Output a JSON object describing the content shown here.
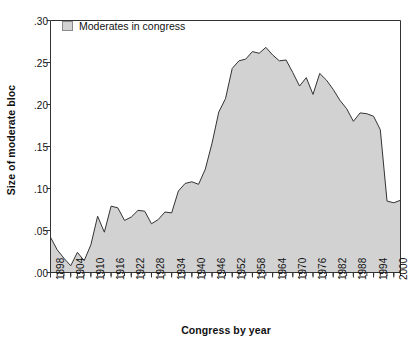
{
  "chart_data": {
    "type": "area",
    "title": "",
    "xlabel": "Congress by year",
    "ylabel": "Size of moderate bloc",
    "legend": [
      {
        "label": "Moderates in congress",
        "color": "#d2d2d2"
      }
    ],
    "legend_position": "top-left-inside",
    "grid": false,
    "xlim": [
      1898,
      2002
    ],
    "ylim": [
      0.0,
      0.3
    ],
    "ytick_values": [
      0.0,
      0.05,
      0.1,
      0.15,
      0.2,
      0.25,
      0.3
    ],
    "ytick_labels": [
      ".00",
      ".05",
      ".10",
      ".15",
      ".20",
      ".25",
      ".30"
    ],
    "xtick_labels": [
      "1898",
      "1904",
      "1910",
      "1916",
      "1922",
      "1928",
      "1934",
      "1940",
      "1946",
      "1952",
      "1958",
      "1964",
      "1970",
      "1976",
      "1982",
      "1988",
      "1994",
      "2000"
    ],
    "xtick_label_interval_years": 6,
    "xtick_minor_interval_years": 2,
    "x": [
      1898,
      1900,
      1902,
      1904,
      1906,
      1908,
      1910,
      1912,
      1914,
      1916,
      1918,
      1920,
      1922,
      1924,
      1926,
      1928,
      1930,
      1932,
      1934,
      1936,
      1938,
      1940,
      1942,
      1944,
      1946,
      1948,
      1950,
      1952,
      1954,
      1956,
      1958,
      1960,
      1962,
      1964,
      1966,
      1968,
      1970,
      1972,
      1974,
      1976,
      1978,
      1980,
      1982,
      1984,
      1986,
      1988,
      1990,
      1992,
      1994,
      1996,
      1998,
      2000,
      2002
    ],
    "values": [
      0.042,
      0.027,
      0.017,
      0.008,
      0.024,
      0.014,
      0.033,
      0.067,
      0.048,
      0.079,
      0.077,
      0.062,
      0.066,
      0.074,
      0.073,
      0.058,
      0.063,
      0.072,
      0.071,
      0.097,
      0.106,
      0.108,
      0.105,
      0.123,
      0.154,
      0.191,
      0.207,
      0.243,
      0.252,
      0.254,
      0.263,
      0.261,
      0.268,
      0.259,
      0.252,
      0.253,
      0.238,
      0.222,
      0.232,
      0.212,
      0.237,
      0.229,
      0.218,
      0.205,
      0.195,
      0.18,
      0.19,
      0.189,
      0.186,
      0.17,
      0.085,
      0.083,
      0.086
    ],
    "series_name": "Moderates in congress",
    "fill_color": "#d2d2d2",
    "line_color": "#333333",
    "axis_color": "#333333"
  }
}
